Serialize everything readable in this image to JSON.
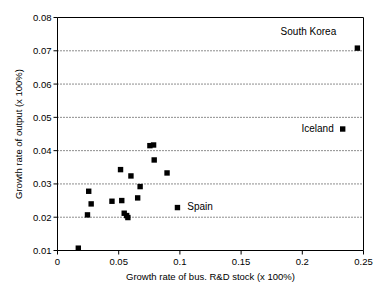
{
  "chart_data": {
    "type": "scatter",
    "title": "",
    "xlabel": "Growth rate of bus. R&D stock (x 100%)",
    "ylabel": "Growth rate of output (x 100%)",
    "xlim": [
      0,
      0.25
    ],
    "ylim": [
      0.01,
      0.08
    ],
    "xticks": [
      0,
      0.05,
      0.1,
      0.15,
      0.2,
      0.25
    ],
    "xtick_labels": [
      "0",
      "0.05",
      "0.1",
      "0.15",
      "0.2",
      "0.25"
    ],
    "yticks": [
      0.01,
      0.02,
      0.03,
      0.04,
      0.05,
      0.06,
      0.07,
      0.08
    ],
    "ytick_labels": [
      "0.01",
      "0.02",
      "0.03",
      "0.04",
      "0.05",
      "0.06",
      "0.07",
      "0.08"
    ],
    "grid": "horizontal-dotted",
    "legend": "none",
    "marker_style": "filled-square",
    "marker_color": "#000000",
    "points": [
      {
        "x": 0.017,
        "y": 0.0107,
        "label": ""
      },
      {
        "x": 0.0245,
        "y": 0.0207,
        "label": ""
      },
      {
        "x": 0.0255,
        "y": 0.0278,
        "label": ""
      },
      {
        "x": 0.0275,
        "y": 0.024,
        "label": ""
      },
      {
        "x": 0.0445,
        "y": 0.0248,
        "label": ""
      },
      {
        "x": 0.0515,
        "y": 0.0343,
        "label": ""
      },
      {
        "x": 0.0525,
        "y": 0.025,
        "label": ""
      },
      {
        "x": 0.0545,
        "y": 0.0212,
        "label": ""
      },
      {
        "x": 0.0565,
        "y": 0.0205,
        "label": ""
      },
      {
        "x": 0.0575,
        "y": 0.0199,
        "label": ""
      },
      {
        "x": 0.06,
        "y": 0.0324,
        "label": ""
      },
      {
        "x": 0.0655,
        "y": 0.0258,
        "label": ""
      },
      {
        "x": 0.0675,
        "y": 0.0292,
        "label": ""
      },
      {
        "x": 0.0755,
        "y": 0.0415,
        "label": ""
      },
      {
        "x": 0.0785,
        "y": 0.0417,
        "label": ""
      },
      {
        "x": 0.079,
        "y": 0.0372,
        "label": ""
      },
      {
        "x": 0.0895,
        "y": 0.0333,
        "label": ""
      },
      {
        "x": 0.098,
        "y": 0.0229,
        "label": "Spain"
      },
      {
        "x": 0.233,
        "y": 0.0465,
        "label": "Iceland"
      },
      {
        "x": 0.245,
        "y": 0.0708,
        "label": "South Korea"
      }
    ],
    "annotations": [
      {
        "text": "South Korea",
        "x": 0.205,
        "y": 0.0758,
        "anchor": "middle"
      },
      {
        "text": "Iceland",
        "x": 0.2125,
        "y": 0.0467,
        "anchor": "middle"
      },
      {
        "text": "Spain",
        "x": 0.1165,
        "y": 0.0231,
        "anchor": "middle"
      }
    ]
  }
}
